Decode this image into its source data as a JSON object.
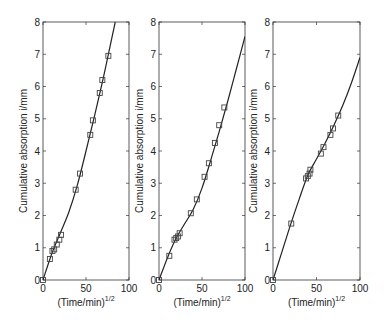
{
  "chart_data": [
    {
      "type": "scatter",
      "panel": 1,
      "title": "",
      "xlabel": "(Time/min)^1/2",
      "ylabel": "Cumulative absorption i/mm",
      "xlim": [
        0,
        100
      ],
      "ylim": [
        0,
        8
      ],
      "xticks": [
        0,
        50,
        100
      ],
      "yticks": [
        0,
        1,
        2,
        3,
        4,
        5,
        6,
        7,
        8
      ],
      "grid": false,
      "series": [
        {
          "name": "measured",
          "marker": "square",
          "x": [
            0,
            8,
            11,
            13,
            16,
            19,
            21,
            38,
            43,
            55,
            58,
            66,
            69,
            76
          ],
          "y": [
            0,
            0.65,
            0.9,
            0.95,
            1.1,
            1.25,
            1.4,
            2.8,
            3.3,
            4.5,
            4.95,
            5.8,
            6.2,
            6.95
          ]
        },
        {
          "name": "fit",
          "line": "solid",
          "x": [
            0,
            10,
            20,
            30,
            40,
            50,
            60,
            70,
            80,
            84
          ],
          "y": [
            0,
            0.8,
            1.45,
            2.1,
            2.95,
            4.0,
            5.1,
            6.25,
            7.5,
            8.0
          ]
        }
      ]
    },
    {
      "type": "scatter",
      "panel": 2,
      "title": "",
      "xlabel": "(Time/min)^1/2",
      "ylabel": "Cumulative absorption i/mm",
      "xlim": [
        0,
        100
      ],
      "ylim": [
        0,
        8
      ],
      "xticks": [
        0,
        50,
        100
      ],
      "yticks": [
        0,
        1,
        2,
        3,
        4,
        5,
        6,
        7,
        8
      ],
      "grid": false,
      "series": [
        {
          "name": "measured",
          "marker": "square",
          "x": [
            0,
            12,
            18,
            20,
            22,
            24,
            37,
            44,
            53,
            58,
            65,
            70,
            76
          ],
          "y": [
            0,
            0.75,
            1.25,
            1.3,
            1.35,
            1.45,
            2.07,
            2.5,
            3.2,
            3.62,
            4.25,
            4.8,
            5.35
          ]
        },
        {
          "name": "fit",
          "line": "solid",
          "x": [
            0,
            10,
            20,
            30,
            40,
            50,
            60,
            70,
            80,
            90,
            100
          ],
          "y": [
            0,
            0.7,
            1.3,
            1.75,
            2.2,
            2.85,
            3.7,
            4.6,
            5.55,
            6.55,
            7.55
          ]
        }
      ]
    },
    {
      "type": "scatter",
      "panel": 3,
      "title": "",
      "xlabel": "(Time/min)^1/2",
      "ylabel": "Cumulative absorption i/mm",
      "xlim": [
        0,
        100
      ],
      "ylim": [
        0,
        8
      ],
      "xticks": [
        0,
        50,
        100
      ],
      "yticks": [
        0,
        1,
        2,
        3,
        4,
        5,
        6,
        7,
        8
      ],
      "grid": false,
      "series": [
        {
          "name": "measured",
          "marker": "square",
          "x": [
            0,
            21,
            38,
            40,
            42,
            43,
            55,
            58,
            66,
            69,
            75
          ],
          "y": [
            0,
            1.75,
            3.15,
            3.22,
            3.3,
            3.42,
            3.92,
            4.12,
            4.5,
            4.7,
            5.1
          ]
        },
        {
          "name": "fit",
          "line": "solid",
          "x": [
            0,
            10,
            20,
            30,
            40,
            50,
            60,
            70,
            80,
            90,
            100
          ],
          "y": [
            0,
            0.85,
            1.7,
            2.5,
            3.25,
            3.75,
            4.25,
            4.8,
            5.4,
            6.1,
            6.9
          ]
        }
      ]
    }
  ],
  "labels": {
    "ylabel": "Cumulative absorption i/mm",
    "xlabel_base": "(Time/min)",
    "xlabel_sup": "1/2",
    "yticks": [
      "0",
      "1",
      "2",
      "3",
      "4",
      "5",
      "6",
      "7",
      "8"
    ],
    "xticks": [
      "0",
      "50",
      "100"
    ]
  },
  "colors": {
    "frame": "#333333",
    "curve": "#222222",
    "marker": "#444444"
  }
}
